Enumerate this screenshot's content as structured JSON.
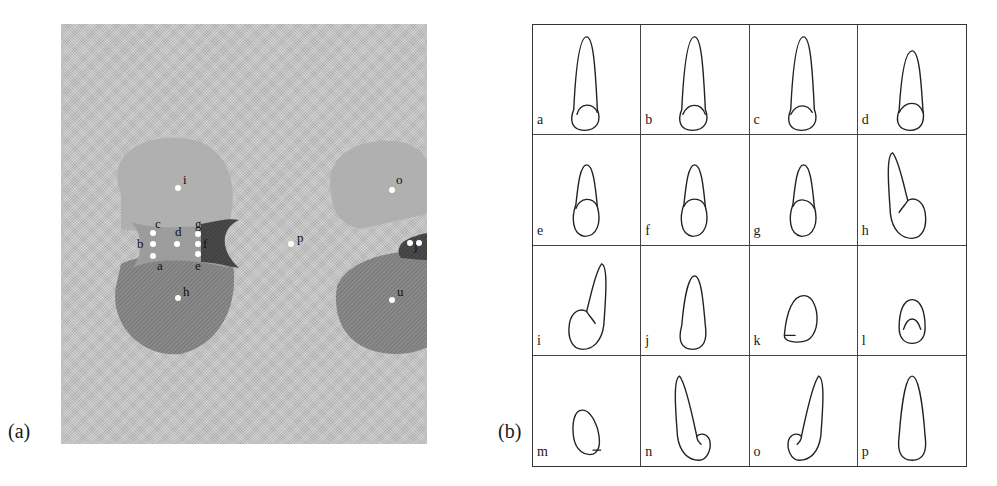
{
  "figure": {
    "panel_a": {
      "label": "(a)",
      "points": [
        {
          "id": "a",
          "x": 92,
          "y": 232,
          "lx": 96,
          "ly": 246
        },
        {
          "id": "b",
          "x": 92,
          "y": 220,
          "lx": 76,
          "ly": 224
        },
        {
          "id": "c",
          "x": 92,
          "y": 209,
          "lx": 94,
          "ly": 204
        },
        {
          "id": "d",
          "x": 116,
          "y": 220,
          "lx": 114,
          "ly": 212
        },
        {
          "id": "e",
          "x": 137,
          "y": 230,
          "lx": 134,
          "ly": 246
        },
        {
          "id": "f",
          "x": 137,
          "y": 220,
          "lx": 142,
          "ly": 224
        },
        {
          "id": "g",
          "x": 137,
          "y": 210,
          "lx": 134,
          "ly": 204
        },
        {
          "id": "h",
          "x": 117,
          "y": 274,
          "lx": 122,
          "ly": 272
        },
        {
          "id": "i",
          "x": 117,
          "y": 164,
          "lx": 122,
          "ly": 160
        },
        {
          "id": "j",
          "x": 349,
          "y": 219,
          "lx": 353,
          "ly": 226
        },
        {
          "id": "k",
          "x": 402,
          "y": 234,
          "lx": 410,
          "ly": 246
        },
        {
          "id": "l",
          "x": 358,
          "y": 219,
          "lx": 365,
          "ly": 225
        },
        {
          "id": "m",
          "x": 402,
          "y": 209,
          "lx": 410,
          "ly": 205
        },
        {
          "id": "o",
          "x": 331,
          "y": 166,
          "lx": 335,
          "ly": 160
        },
        {
          "id": "p",
          "x": 230,
          "y": 220,
          "lx": 236,
          "ly": 218
        },
        {
          "id": "u",
          "x": 331,
          "y": 276,
          "lx": 336,
          "ly": 272
        }
      ]
    },
    "panel_b": {
      "label": "(b)",
      "cells": [
        {
          "label": "a",
          "shape": "tall-tip-left"
        },
        {
          "label": "b",
          "shape": "tall"
        },
        {
          "label": "c",
          "shape": "tall-tip-right"
        },
        {
          "label": "d",
          "shape": "medium"
        },
        {
          "label": "e",
          "shape": "short-left"
        },
        {
          "label": "f",
          "shape": "short"
        },
        {
          "label": "g",
          "shape": "short-right"
        },
        {
          "label": "h",
          "shape": "bent-left"
        },
        {
          "label": "i",
          "shape": "bent-right"
        },
        {
          "label": "j",
          "shape": "teardrop"
        },
        {
          "label": "k",
          "shape": "blob-left"
        },
        {
          "label": "l",
          "shape": "cap"
        },
        {
          "label": "m",
          "shape": "blob-right"
        },
        {
          "label": "n",
          "shape": "bent-left-low"
        },
        {
          "label": "o",
          "shape": "bent-right-low"
        },
        {
          "label": "p",
          "shape": "long-teardrop"
        }
      ]
    }
  }
}
